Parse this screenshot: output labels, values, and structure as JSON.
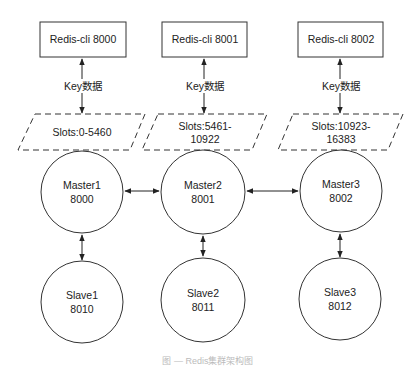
{
  "diagram": {
    "type": "redis-cluster-architecture",
    "columns": [
      {
        "client": "Redis-cli 8000",
        "edge_label": "Key数据",
        "slots": [
          "Slots:0-5460"
        ],
        "master": {
          "name": "Master1",
          "port": "8000"
        },
        "slave": {
          "name": "Slave1",
          "port": "8010"
        }
      },
      {
        "client": "Redis-cli 8001",
        "edge_label": "Key数据",
        "slots": [
          "Slots:5461-",
          "10922"
        ],
        "master": {
          "name": "Master2",
          "port": "8001"
        },
        "slave": {
          "name": "Slave2",
          "port": "8011"
        }
      },
      {
        "client": "Redis-cli 8002",
        "edge_label": "Key数据",
        "slots": [
          "Slots:10923-",
          "16383"
        ],
        "master": {
          "name": "Master3",
          "port": "8002"
        },
        "slave": {
          "name": "Slave3",
          "port": "8012"
        }
      }
    ],
    "edges": [
      {
        "from": "Redis-cli 8000",
        "to": "Slots:0-5460",
        "bidirectional": true,
        "label": "Key数据"
      },
      {
        "from": "Redis-cli 8001",
        "to": "Slots:5461-10922",
        "bidirectional": true,
        "label": "Key数据"
      },
      {
        "from": "Redis-cli 8002",
        "to": "Slots:10923-16383",
        "bidirectional": true,
        "label": "Key数据"
      },
      {
        "from": "Master1",
        "to": "Master2",
        "bidirectional": true
      },
      {
        "from": "Master2",
        "to": "Master3",
        "bidirectional": true
      },
      {
        "from": "Master1",
        "to": "Slave1",
        "bidirectional": true
      },
      {
        "from": "Master2",
        "to": "Slave2",
        "bidirectional": true
      },
      {
        "from": "Master3",
        "to": "Slave3",
        "bidirectional": true
      }
    ],
    "caption": "图 — Redis集群架构图"
  },
  "colors": {
    "stroke": "#333333",
    "background": "#ffffff",
    "text": "#222222"
  }
}
